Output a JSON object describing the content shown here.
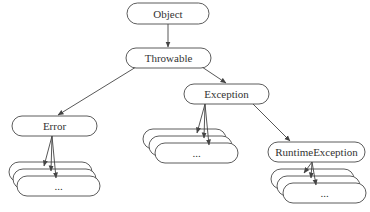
{
  "diagram": {
    "colors": {
      "stroke": "#4a4a4a",
      "text": "#333333",
      "background": "#ffffff"
    },
    "nodes": [
      {
        "id": "object",
        "label": "Object",
        "x": 127,
        "y": 3,
        "w": 82,
        "h": 21
      },
      {
        "id": "throwable",
        "label": "Throwable",
        "x": 126,
        "y": 48,
        "w": 85,
        "h": 20
      },
      {
        "id": "exception",
        "label": "Exception",
        "x": 184,
        "y": 84,
        "w": 85,
        "h": 20
      },
      {
        "id": "error",
        "label": "Error",
        "x": 12,
        "y": 116,
        "w": 85,
        "h": 20
      },
      {
        "id": "runtime-exception",
        "label": "RuntimeException",
        "x": 268,
        "y": 142,
        "w": 97,
        "h": 20
      }
    ],
    "stacks": [
      {
        "id": "error-subclasses",
        "parent": "error",
        "label": "...",
        "front": {
          "x": 17,
          "y": 176,
          "w": 83,
          "h": 20
        },
        "dx": -4,
        "dy": -7,
        "count": 3,
        "arrow_from_x": 52
      },
      {
        "id": "exception-subclasses",
        "parent": "exception",
        "label": "...",
        "front": {
          "x": 155,
          "y": 143,
          "w": 83,
          "h": 20
        },
        "dx": -6,
        "dy": -7,
        "count": 3,
        "arrow_from_x": 205
      },
      {
        "id": "runtime-exception-subclasses",
        "parent": "runtime-exception",
        "label": "...",
        "front": {
          "x": 283,
          "y": 183,
          "w": 83,
          "h": 20
        },
        "dx": -6,
        "dy": -7,
        "count": 3,
        "arrow_from_x": 312
      }
    ],
    "edges": [
      {
        "from": "object",
        "to": "throwable",
        "x1": 168,
        "y1": 24,
        "x2": 168,
        "y2": 47
      },
      {
        "from": "throwable",
        "to": "error",
        "x1": 136,
        "y1": 67,
        "x2": 58,
        "y2": 115
      },
      {
        "from": "throwable",
        "to": "exception",
        "x1": 202,
        "y1": 67,
        "x2": 226,
        "y2": 83
      },
      {
        "from": "exception",
        "to": "runtime-exception",
        "x1": 252,
        "y1": 103,
        "x2": 290,
        "y2": 141
      }
    ]
  }
}
